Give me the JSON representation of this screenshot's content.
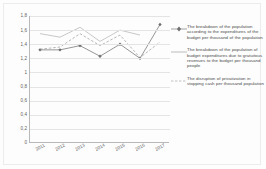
{
  "chart_data": {
    "type": "line",
    "title": "",
    "subtitle": "",
    "xlabel": "",
    "ylabel": "",
    "categories": [
      "2011",
      "2012",
      "2013",
      "2014",
      "2015",
      "2016",
      "2017"
    ],
    "ylim": [
      0,
      1.8
    ],
    "yticks": [
      "0",
      "0,2",
      "0,4",
      "0,6",
      "0,8",
      "1",
      "1,2",
      "1,4",
      "1,6",
      "1,8"
    ],
    "ytick_values": [
      0,
      0.2,
      0.4,
      0.6,
      0.8,
      1.0,
      1.2,
      1.4,
      1.6,
      1.8
    ],
    "grid": true,
    "legend_position": "right",
    "series": [
      {
        "name": "The breakdown of the population according to the expenditures of the budget per thousand of the population",
        "marker": "diamond",
        "color": "#7b7b7b",
        "values": [
          1.32,
          1.32,
          1.38,
          1.23,
          1.4,
          1.2,
          1.68
        ]
      },
      {
        "name": "The breakdown of the population of budget expenditures due to gratuitous revenues to the budget per thousand people",
        "marker": "none",
        "color": "#b0b0b0",
        "values": [
          1.55,
          1.5,
          1.64,
          1.44,
          1.6,
          1.53,
          null
        ]
      },
      {
        "name": "The disruption of privatization in stopping cash per thousand population",
        "marker": "none",
        "color": "#9a9a9a",
        "values": [
          1.33,
          1.36,
          1.55,
          1.38,
          1.53,
          1.21,
          1.43
        ]
      }
    ]
  }
}
